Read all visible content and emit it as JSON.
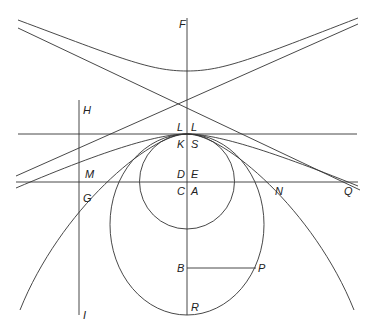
{
  "diagram": {
    "type": "conic-sections",
    "stroke_color": "#333333",
    "labels": {
      "F": {
        "text": "F",
        "x": 179,
        "y": 19
      },
      "H": {
        "text": "H",
        "x": 83,
        "y": 105
      },
      "L1": {
        "text": "L",
        "x": 177,
        "y": 123
      },
      "L2": {
        "text": "L",
        "x": 191,
        "y": 123
      },
      "K": {
        "text": "K",
        "x": 177,
        "y": 139
      },
      "S": {
        "text": "S",
        "x": 191,
        "y": 139
      },
      "M": {
        "text": "M",
        "x": 86,
        "y": 169
      },
      "D": {
        "text": "D",
        "x": 177,
        "y": 169
      },
      "E": {
        "text": "E",
        "x": 191,
        "y": 169
      },
      "G": {
        "text": "G",
        "x": 83,
        "y": 193
      },
      "C": {
        "text": "C",
        "x": 177,
        "y": 186
      },
      "A": {
        "text": "A",
        "x": 191,
        "y": 186
      },
      "N": {
        "text": "N",
        "x": 275,
        "y": 186
      },
      "Q": {
        "text": "Q",
        "x": 344,
        "y": 186
      },
      "B": {
        "text": "B",
        "x": 177,
        "y": 263
      },
      "P": {
        "text": "P",
        "x": 258,
        "y": 263
      },
      "I": {
        "text": "I",
        "x": 83,
        "y": 310
      },
      "R": {
        "text": "R",
        "x": 191,
        "y": 301
      }
    }
  }
}
